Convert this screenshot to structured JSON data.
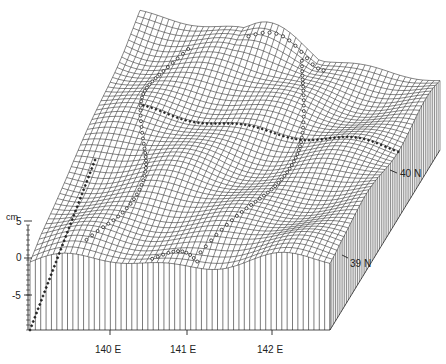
{
  "chart_data": {
    "type": "surface3d",
    "title": "",
    "z_axis": {
      "label": "cm",
      "ticks": [
        "5",
        "0",
        "-5"
      ],
      "tick_values": [
        5,
        0,
        -5
      ],
      "range": [
        -9,
        7
      ]
    },
    "x_axis": {
      "ticks": [
        "140 E",
        "141 E",
        "142 E"
      ],
      "tick_values": [
        140,
        141,
        142
      ]
    },
    "y_axis": {
      "ticks": [
        "39 N",
        "40 N"
      ],
      "tick_values": [
        39,
        40
      ]
    },
    "grid": true,
    "legend": null
  },
  "labels": {
    "unit": "cm",
    "z5": "5",
    "z0": "0",
    "zm5": "-5",
    "x140": "140 E",
    "x141": "141 E",
    "x142": "142 E",
    "y39": "39 N",
    "y40": "40 N"
  },
  "colors": {
    "ink": "#222222",
    "background": "#ffffff"
  }
}
